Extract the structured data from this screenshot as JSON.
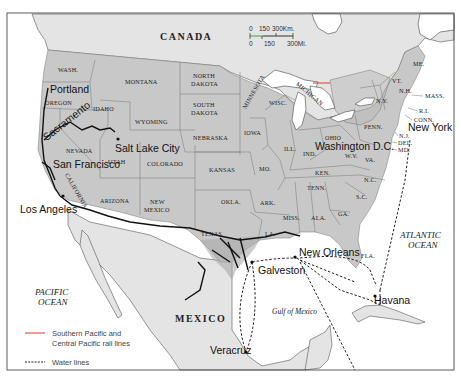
{
  "map": {
    "countries": {
      "canada": "CANADA",
      "mexico": "MEXICO"
    },
    "oceans": {
      "pacific_line1": "PACIFIC",
      "pacific_line2": "OCEAN",
      "atlantic_line1": "ATLANTIC",
      "atlantic_line2": "OCEAN",
      "gulf": "Gulf of Mexico"
    },
    "states": {
      "wash": "WASH.",
      "oregon": "OREGON",
      "idaho": "IDAHO",
      "montana": "MONTANA",
      "wyoming": "WYOMING",
      "nevada": "NEVADA",
      "utah": "UTAH",
      "colorado": "COLORADO",
      "california": "CALIFORNIA",
      "arizona": "ARIZONA",
      "new_mexico_1": "NEW",
      "new_mexico_2": "MEXICO",
      "north_dakota_1": "NORTH",
      "north_dakota_2": "DAKOTA",
      "south_dakota_1": "SOUTH",
      "south_dakota_2": "DAKOTA",
      "nebraska": "NEBRASKA",
      "kansas": "KANSAS",
      "okla": "OKLA.",
      "texas": "TEXAS",
      "minnesota": "MINNESOTA",
      "iowa": "IOWA",
      "mo": "MO.",
      "ark": "ARK.",
      "la": "LA.",
      "wisc": "WISC.",
      "ill": "ILL.",
      "michigan": "MICHIGAN",
      "ind": "IND.",
      "ohio": "OHIO",
      "ken": "KEN.",
      "tenn": "TENN.",
      "miss": "MISS.",
      "ala": "ALA.",
      "ga": "GA.",
      "fla": "FLA.",
      "sc": "S.C.",
      "nc": "N.C.",
      "va": "VA.",
      "wv": "W.V.",
      "penn": "PENN.",
      "ny": "N.Y.",
      "vt": "VT.",
      "nh": "N.H.",
      "me": "ME.",
      "mass": "MASS.",
      "ri": "R.I.",
      "conn": "CONN.",
      "nj": "N.J.",
      "del": "DEL.",
      "md": "MD."
    },
    "cities": {
      "portland": "Portland",
      "sacramento": "Sacramento",
      "salt_lake_city": "Salt Lake City",
      "san_francisco": "San Francisco",
      "los_angeles": "Los Angeles",
      "galveston": "Galveston",
      "new_orleans": "New Orleans",
      "havana": "Havana",
      "veracruz": "Veracruz",
      "washington_dc": "Washington D.C.",
      "new_york": "New York"
    },
    "scale": {
      "km_labels": [
        "0",
        "150",
        "300Km."
      ],
      "mi_labels": [
        "0",
        "150",
        "300Mi."
      ]
    },
    "legend": {
      "rail_line1": "Southern Pacific and",
      "rail_line2": "Central Pacific rail lines",
      "rail_color": "#e03a2a",
      "water": "Water lines"
    }
  }
}
